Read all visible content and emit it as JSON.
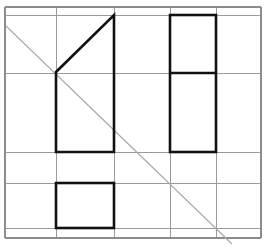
{
  "figure": {
    "canvas": {
      "width": 266,
      "height": 248,
      "background": "#ffffff"
    },
    "colors": {
      "background": "#ffffff",
      "grid_line": "#9a9a9a",
      "border_line": "#8c8c8c",
      "shape_stroke": "#111111",
      "diagonal_stroke": "#a8a8a8"
    },
    "stroke_widths": {
      "grid_line": 1,
      "border_line": 1.2,
      "shape_stroke": 2.6,
      "diagonal_stroke": 1.1
    }
  },
  "chart_data": {
    "type": "diagram",
    "xlim": [
      0,
      266
    ],
    "ylim": [
      0,
      248
    ],
    "grid": {
      "label": "background grid",
      "x_positions": [
        5,
        56,
        114,
        170,
        216,
        261
      ],
      "y_positions": [
        7,
        15,
        73,
        152,
        183,
        228,
        238
      ],
      "vertical_lines": [
        {
          "name": "grid-v-0",
          "x": 5,
          "y1": 7,
          "y2": 238
        },
        {
          "name": "grid-v-1",
          "x": 56,
          "y1": 7,
          "y2": 238
        },
        {
          "name": "grid-v-2",
          "x": 114,
          "y1": 7,
          "y2": 238
        },
        {
          "name": "grid-v-3",
          "x": 170,
          "y1": 7,
          "y2": 238
        },
        {
          "name": "grid-v-4",
          "x": 216,
          "y1": 7,
          "y2": 238
        },
        {
          "name": "grid-v-5",
          "x": 261,
          "y1": 7,
          "y2": 238
        }
      ],
      "horizontal_lines": [
        {
          "name": "grid-h-0",
          "y": 7,
          "x1": 5,
          "x2": 261
        },
        {
          "name": "grid-h-1",
          "y": 15,
          "x1": 5,
          "x2": 261
        },
        {
          "name": "grid-h-2",
          "y": 73,
          "x1": 5,
          "x2": 261
        },
        {
          "name": "grid-h-3",
          "y": 152,
          "x1": 5,
          "x2": 261
        },
        {
          "name": "grid-h-4",
          "y": 183,
          "x1": 5,
          "x2": 261
        },
        {
          "name": "grid-h-5",
          "y": 228,
          "x1": 5,
          "x2": 261
        },
        {
          "name": "grid-h-6",
          "y": 238,
          "x1": 5,
          "x2": 261
        }
      ]
    },
    "shapes": [
      {
        "name": "left-trapezoid",
        "kind": "polygon",
        "closed": true,
        "stroke": "#111111",
        "fill": "none",
        "points": [
          [
            56,
            72
          ],
          [
            114,
            15
          ],
          [
            114,
            152
          ],
          [
            56,
            152
          ]
        ],
        "points_str": "56,72 114,15 114,152 56,152"
      },
      {
        "name": "right-tall-rectangle",
        "kind": "rect",
        "closed": true,
        "stroke": "#111111",
        "fill": "none",
        "x": 170,
        "y": 15,
        "width": 46,
        "height": 137,
        "points_str": "170,15 216,15 216,152 170,152"
      },
      {
        "name": "right-rectangle-divider",
        "kind": "line",
        "stroke": "#111111",
        "x1": 170,
        "y1": 73,
        "x2": 216,
        "y2": 73
      },
      {
        "name": "bottom-left-rectangle",
        "kind": "rect",
        "closed": true,
        "stroke": "#111111",
        "fill": "none",
        "x": 56,
        "y": 183,
        "width": 58,
        "height": 45,
        "points_str": "56,183 114,183 114,228 56,228"
      }
    ],
    "diagonal": {
      "name": "gray-diagonal",
      "kind": "line",
      "stroke": "#a8a8a8",
      "x1": 6,
      "y1": 26,
      "x2": 232,
      "y2": 244,
      "passes_through": [
        [
          56,
          72
        ],
        [
          114,
          127
        ],
        [
          170,
          181
        ],
        [
          216,
          225
        ]
      ]
    }
  }
}
